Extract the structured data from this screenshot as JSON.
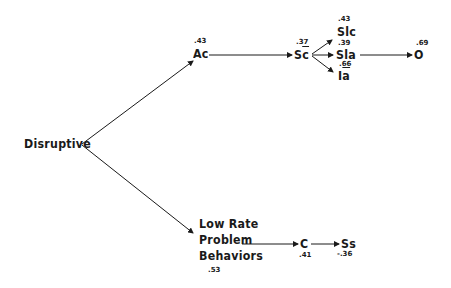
{
  "nodes": {
    "disruptive": {
      "label": "Disruptive"
    },
    "ac": {
      "label": "Ac",
      "coef": ".43"
    },
    "sc": {
      "label_main": "S",
      "label_bar": "c",
      "coef": ".37"
    },
    "slc": {
      "label": "Slc",
      "coef": ".43"
    },
    "sla": {
      "label": "Sla",
      "coef": ".39"
    },
    "ia": {
      "label_main": "I",
      "label_bar": "a",
      "coef": ".66"
    },
    "o": {
      "label": "O",
      "coef": ".69"
    },
    "lrpb": {
      "line1": "Low Rate",
      "line2": "Problem",
      "line3": "Behaviors",
      "coef": ".53"
    },
    "c": {
      "label": "C",
      "coef": ".41"
    },
    "ss": {
      "label": "Ss",
      "coef": "-.36"
    }
  },
  "edges": [
    [
      "disruptive",
      "ac"
    ],
    [
      "disruptive",
      "lrpb"
    ],
    [
      "ac",
      "sc"
    ],
    [
      "sc",
      "slc"
    ],
    [
      "sc",
      "sla"
    ],
    [
      "sc",
      "ia"
    ],
    [
      "sla",
      "o"
    ],
    [
      "lrpb",
      "c"
    ],
    [
      "c",
      "ss"
    ]
  ],
  "colors": {
    "ink": "#1a1a1a",
    "background": "#ffffff"
  }
}
